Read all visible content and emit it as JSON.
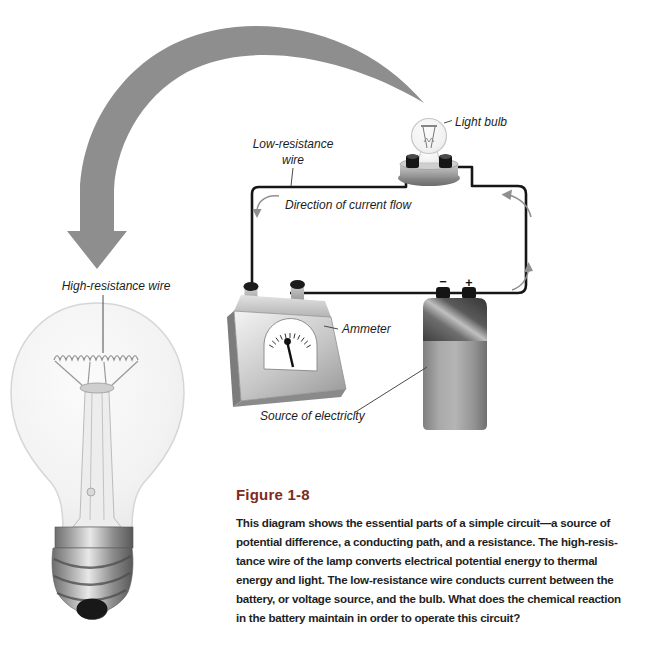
{
  "figure": {
    "label": "Figure 1-8",
    "caption": "This diagram shows the essential parts of a simple circuit—a source of\npotential difference, a conducting path, and a resistance. The high-resis-\ntance wire of the lamp converts electrical potential energy to thermal\nenergy and light. The low-resistance wire conducts current between the\nbattery, or voltage source, and the bulb. What does the chemical reaction\nin the battery maintain in order to operate this circuit?"
  },
  "diagram": {
    "labels": {
      "light_bulb": "Light bulb",
      "low_resistance_wire": "Low-resistance",
      "low_resistance_wire_2": "wire",
      "direction_of_current_flow": "Direction of current flow",
      "ammeter": "Ammeter",
      "source_of_electricity": "Source of electricity",
      "high_resistance_wire": "High-resistance wire",
      "battery_negative_terminal": "−",
      "battery_positive_terminal": "+"
    },
    "colors": {
      "figure_label": "#7d2b20",
      "emphasis_arrow": "#8e8e8e",
      "wire": "#161616"
    }
  }
}
